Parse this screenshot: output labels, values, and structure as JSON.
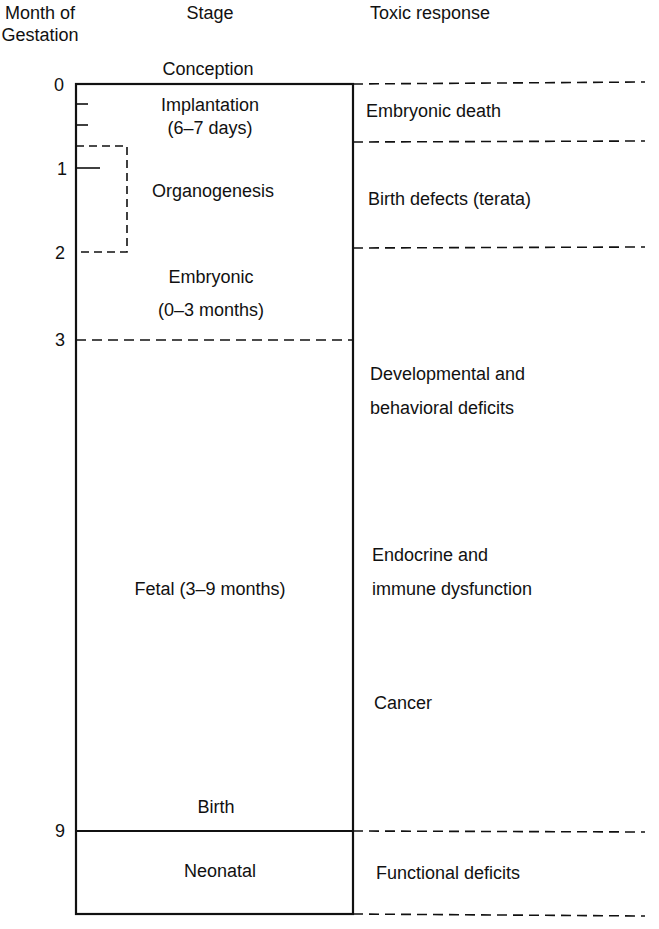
{
  "headers": {
    "month": "Month of\nGestation",
    "month_line1": "Month of",
    "month_line2": "Gestation",
    "stage": "Stage",
    "toxic": "Toxic response"
  },
  "month_ticks": [
    "0",
    "1",
    "2",
    "3",
    "9"
  ],
  "stages": {
    "conception": "Conception",
    "implantation_1": "Implantation",
    "implantation_2": "(6–7 days)",
    "organogenesis": "Organogenesis",
    "embryonic_1": "Embryonic",
    "embryonic_2": "(0–3 months)",
    "fetal": "Fetal (3–9 months)",
    "birth": "Birth",
    "neonatal": "Neonatal"
  },
  "toxic_responses": {
    "embryonic_death": "Embryonic death",
    "birth_defects": "Birth defects (terata)",
    "developmental_1": "Developmental and",
    "developmental_2": "behavioral deficits",
    "endocrine_1": "Endocrine and",
    "endocrine_2": "immune dysfunction",
    "cancer": "Cancer",
    "functional": "Functional deficits"
  },
  "colors": {
    "ink": "#111111",
    "background": "#ffffff"
  }
}
